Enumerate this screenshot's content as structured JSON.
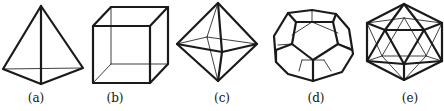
{
  "figure": {
    "panels": [
      {
        "id": "a",
        "label": "(a)",
        "solid": "tetrahedron",
        "label_x": 36
      },
      {
        "id": "b",
        "label": "(b)",
        "solid": "cube",
        "label_x": 115
      },
      {
        "id": "c",
        "label": "(c)",
        "solid": "octahedron",
        "label_x": 222
      },
      {
        "id": "d",
        "label": "(d)",
        "solid": "dodecahedron",
        "label_x": 316
      },
      {
        "id": "e",
        "label": "(e)",
        "solid": "icosahedron",
        "label_x": 410
      }
    ],
    "colors": {
      "line": "#1a1a1a",
      "background": "#ffffff"
    }
  }
}
